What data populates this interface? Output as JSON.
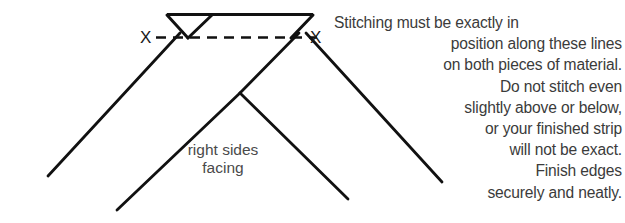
{
  "figure": {
    "stroke_color": "#111111",
    "text_color": "#3b3b3b",
    "label_color": "#4a4a4a",
    "background_color": "#ffffff"
  },
  "markers": {
    "left_x": "X",
    "right_x": "X"
  },
  "center_label": {
    "line1": "right sides",
    "line2": "facing"
  },
  "instructions": {
    "lines": [
      "Stitching must be exactly in",
      "position along these lines",
      "on both pieces of material.",
      "Do not stitch even",
      "slightly above or below,",
      "or your finished strip",
      "will not be exact.",
      "Finish edges",
      "securely and neatly."
    ]
  }
}
